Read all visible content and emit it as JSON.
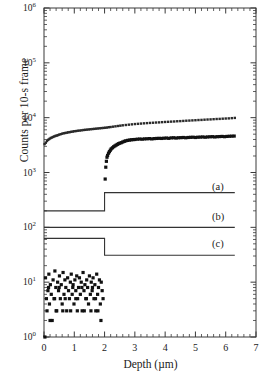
{
  "chart_data": {
    "type": "scatter",
    "title": "",
    "xlabel": "Depth (µm)",
    "ylabel": "Counts per 10-s frame",
    "xlim": [
      0,
      7
    ],
    "ylim": [
      1,
      1000000
    ],
    "yscale": "log",
    "xscale": "linear",
    "grid": false,
    "legend": "none",
    "xticks": [
      "0",
      "1",
      "2",
      "3",
      "4",
      "5",
      "6",
      "7"
    ],
    "xtick_values": [
      0,
      1,
      2,
      3,
      4,
      5,
      6,
      7
    ],
    "ytick_labels": [
      "10⁰",
      "10¹",
      "10²",
      "10³",
      "10⁴",
      "10⁵",
      "10⁶"
    ],
    "ytick_mantissa": "10",
    "ytick_exponents": [
      "0",
      "1",
      "2",
      "3",
      "4",
      "5",
      "6"
    ],
    "ytick_values": [
      1,
      10,
      100,
      1000,
      10000,
      100000,
      1000000
    ],
    "annotations": [
      {
        "text": "(a)",
        "x": 5.55,
        "y": 520
      },
      {
        "text": "(b)",
        "x": 5.55,
        "y": 148
      },
      {
        "text": "(c)",
        "x": 5.55,
        "y": 47
      }
    ],
    "series": [
      {
        "name": "upper-scatter",
        "style": "points",
        "marker_size": 1.2,
        "color": "#2a2a2a",
        "x": [
          0.02,
          0.06,
          0.1,
          0.14,
          0.18,
          0.22,
          0.26,
          0.3,
          0.34,
          0.38,
          0.42,
          0.46,
          0.5,
          0.55,
          0.6,
          0.65,
          0.7,
          0.75,
          0.8,
          0.85,
          0.9,
          0.95,
          1.0,
          1.06,
          1.12,
          1.18,
          1.24,
          1.3,
          1.36,
          1.42,
          1.48,
          1.54,
          1.6,
          1.66,
          1.72,
          1.78,
          1.84,
          1.9,
          1.96,
          2.02,
          2.08,
          2.14,
          2.2,
          2.28,
          2.36,
          2.44,
          2.52,
          2.6,
          2.7,
          2.8,
          2.9,
          3.0,
          3.1,
          3.2,
          3.3,
          3.4,
          3.5,
          3.6,
          3.7,
          3.8,
          3.9,
          4.0,
          4.1,
          4.2,
          4.3,
          4.4,
          4.5,
          4.6,
          4.7,
          4.8,
          4.9,
          5.0,
          5.1,
          5.2,
          5.3,
          5.4,
          5.5,
          5.6,
          5.7,
          5.8,
          5.9,
          6.0,
          6.1,
          6.2,
          6.3
        ],
        "y": [
          3300,
          3500,
          3750,
          3950,
          4100,
          4250,
          4350,
          4450,
          4550,
          4650,
          4720,
          4800,
          4900,
          5000,
          5100,
          5200,
          5250,
          5320,
          5400,
          5450,
          5520,
          5580,
          5650,
          5700,
          5780,
          5820,
          5880,
          5950,
          6000,
          6050,
          6100,
          6150,
          6200,
          6250,
          6300,
          6350,
          6400,
          6450,
          6500,
          6550,
          6600,
          6700,
          6750,
          6850,
          6950,
          7050,
          7150,
          7250,
          7350,
          7450,
          7550,
          7650,
          7720,
          7800,
          7880,
          7950,
          8020,
          8080,
          8150,
          8200,
          8280,
          8350,
          8400,
          8470,
          8520,
          8600,
          8650,
          8720,
          8800,
          8850,
          8920,
          8980,
          9050,
          9100,
          9180,
          9250,
          9300,
          9380,
          9450,
          9500,
          9580,
          9650,
          9700,
          9800,
          9900
        ]
      },
      {
        "name": "lower-scatter",
        "style": "points",
        "marker_size": 1.6,
        "color": "#111111",
        "x": [
          2.02,
          2.04,
          2.06,
          2.08,
          2.1,
          2.13,
          2.16,
          2.19,
          2.22,
          2.26,
          2.3,
          2.34,
          2.38,
          2.42,
          2.46,
          2.5,
          2.55,
          2.6,
          2.65,
          2.7,
          2.76,
          2.82,
          2.88,
          2.94,
          3.0,
          3.08,
          3.16,
          3.24,
          3.32,
          3.4,
          3.48,
          3.56,
          3.64,
          3.72,
          3.8,
          3.88,
          3.96,
          4.04,
          4.12,
          4.2,
          4.28,
          4.36,
          4.44,
          4.52,
          4.6,
          4.68,
          4.76,
          4.84,
          4.92,
          5.0,
          5.08,
          5.16,
          5.24,
          5.32,
          5.4,
          5.48,
          5.56,
          5.64,
          5.72,
          5.8,
          5.88,
          5.96,
          6.04,
          6.12,
          6.2,
          6.28
        ],
        "y": [
          760,
          1250,
          1600,
          1900,
          2050,
          2250,
          2400,
          2550,
          2700,
          2820,
          2950,
          3050,
          3150,
          3250,
          3350,
          3420,
          3500,
          3600,
          3700,
          3780,
          3850,
          3900,
          3950,
          3980,
          4000,
          4050,
          4080,
          4050,
          4100,
          4120,
          4150,
          4100,
          4150,
          4180,
          4200,
          4180,
          4220,
          4250,
          4200,
          4280,
          4300,
          4250,
          4300,
          4320,
          4350,
          4300,
          4350,
          4380,
          4400,
          4350,
          4400,
          4420,
          4450,
          4400,
          4450,
          4480,
          4500,
          4450,
          4500,
          4520,
          4550,
          4500,
          4550,
          4580,
          4600,
          4620
        ]
      },
      {
        "name": "background-noise-scatter",
        "style": "points",
        "marker_size": 1.6,
        "color": "#111111",
        "x": [
          0.03,
          0.05,
          0.08,
          0.1,
          0.13,
          0.16,
          0.18,
          0.21,
          0.24,
          0.27,
          0.3,
          0.33,
          0.36,
          0.39,
          0.42,
          0.45,
          0.48,
          0.51,
          0.54,
          0.57,
          0.6,
          0.63,
          0.66,
          0.69,
          0.72,
          0.75,
          0.78,
          0.81,
          0.84,
          0.87,
          0.9,
          0.93,
          0.96,
          0.99,
          1.02,
          1.05,
          1.08,
          1.11,
          1.14,
          1.17,
          1.2,
          1.23,
          1.26,
          1.29,
          1.32,
          1.35,
          1.38,
          1.41,
          1.44,
          1.47,
          1.5,
          1.53,
          1.56,
          1.59,
          1.62,
          1.65,
          1.68,
          1.71,
          1.74,
          1.77,
          1.8,
          1.83,
          1.86,
          1.89,
          1.92,
          1.95,
          0.2,
          0.4,
          0.62,
          0.88,
          1.1,
          1.33,
          1.55,
          1.78,
          0.35,
          0.7,
          1.05,
          1.4,
          1.7,
          0.15,
          0.5,
          0.95,
          1.25,
          1.6,
          1.88
        ],
        "y": [
          1.0,
          12,
          5,
          3,
          7,
          14,
          4,
          9,
          6,
          2,
          11,
          5,
          16,
          8,
          3,
          10,
          7,
          13,
          5,
          9,
          4,
          15,
          6,
          11,
          8,
          3,
          12,
          7,
          5,
          10,
          14,
          6,
          9,
          4,
          11,
          7,
          13,
          5,
          8,
          12,
          6,
          10,
          3,
          15,
          7,
          9,
          5,
          11,
          8,
          4,
          13,
          6,
          10,
          7,
          12,
          5,
          9,
          3,
          14,
          6,
          8,
          11,
          4,
          10,
          7,
          5,
          2,
          3,
          3,
          3,
          3,
          3,
          3,
          3,
          5,
          5,
          5,
          5,
          5,
          8,
          8,
          8,
          8,
          8,
          2
        ]
      }
    ],
    "step_curves": [
      {
        "name": "curve-a",
        "label": "(a)",
        "color": "#333333",
        "x": [
          0,
          2.0,
          2.0,
          6.3
        ],
        "y": [
          200,
          200,
          430,
          430
        ]
      },
      {
        "name": "curve-b",
        "label": "(b)",
        "color": "#333333",
        "x": [
          0,
          6.3
        ],
        "y": [
          100,
          100
        ]
      },
      {
        "name": "curve-c",
        "label": "(c)",
        "color": "#333333",
        "x": [
          0,
          2.0,
          2.0,
          6.3
        ],
        "y": [
          63,
          63,
          31,
          31
        ]
      }
    ]
  },
  "axes": {
    "xlabel": "Depth (µm)",
    "ylabel": "Counts per 10-s frame",
    "xticks": [
      "0",
      "1",
      "2",
      "3",
      "4",
      "5",
      "6",
      "7"
    ],
    "yticks": [
      {
        "mantissa": "10",
        "exp": "6"
      },
      {
        "mantissa": "10",
        "exp": "5"
      },
      {
        "mantissa": "10",
        "exp": "4"
      },
      {
        "mantissa": "10",
        "exp": "3"
      },
      {
        "mantissa": "10",
        "exp": "2"
      },
      {
        "mantissa": "10",
        "exp": "1"
      },
      {
        "mantissa": "10",
        "exp": "0"
      }
    ]
  },
  "labels": {
    "a": "(a)",
    "b": "(b)",
    "c": "(c)"
  },
  "colors": {
    "axis": "#3a3a3a",
    "data": "#111111",
    "curve": "#333333",
    "background": "#ffffff"
  }
}
